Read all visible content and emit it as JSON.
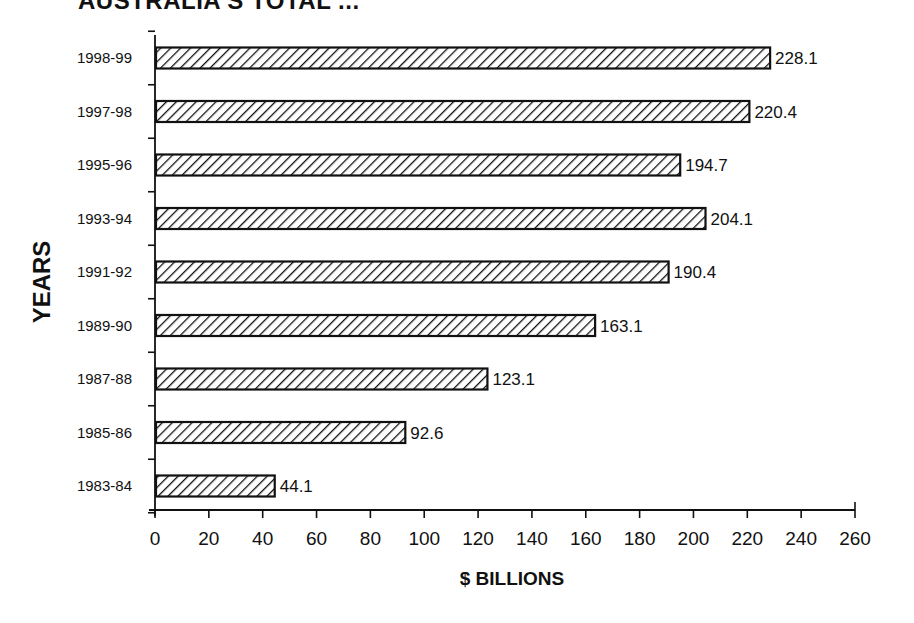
{
  "chart_data": {
    "type": "bar",
    "orientation": "horizontal",
    "title": "AUSTRALIA'S TOTAL ...",
    "xlabel": "$ BILLIONS",
    "ylabel": "YEARS",
    "categories": [
      "1998-99",
      "1997-98",
      "1995-96",
      "1993-94",
      "1991-92",
      "1989-90",
      "1987-88",
      "1985-86",
      "1983-84"
    ],
    "values": [
      228.1,
      220.4,
      194.7,
      204.1,
      190.4,
      163.1,
      123.1,
      92.6,
      44.1
    ],
    "value_labels": [
      "228.1",
      "220.4",
      "194.7",
      "204.1",
      "190.4",
      "163.1",
      "123.1",
      "92.6",
      "44.1"
    ],
    "xlim": [
      0,
      260
    ],
    "xticks": [
      0,
      20,
      40,
      60,
      80,
      100,
      120,
      140,
      160,
      180,
      200,
      220,
      240,
      260
    ],
    "grid": false,
    "legend": null,
    "bar_fill": "diagonal hatch",
    "colors": {
      "ink": "#111111",
      "background": "#ffffff"
    }
  }
}
